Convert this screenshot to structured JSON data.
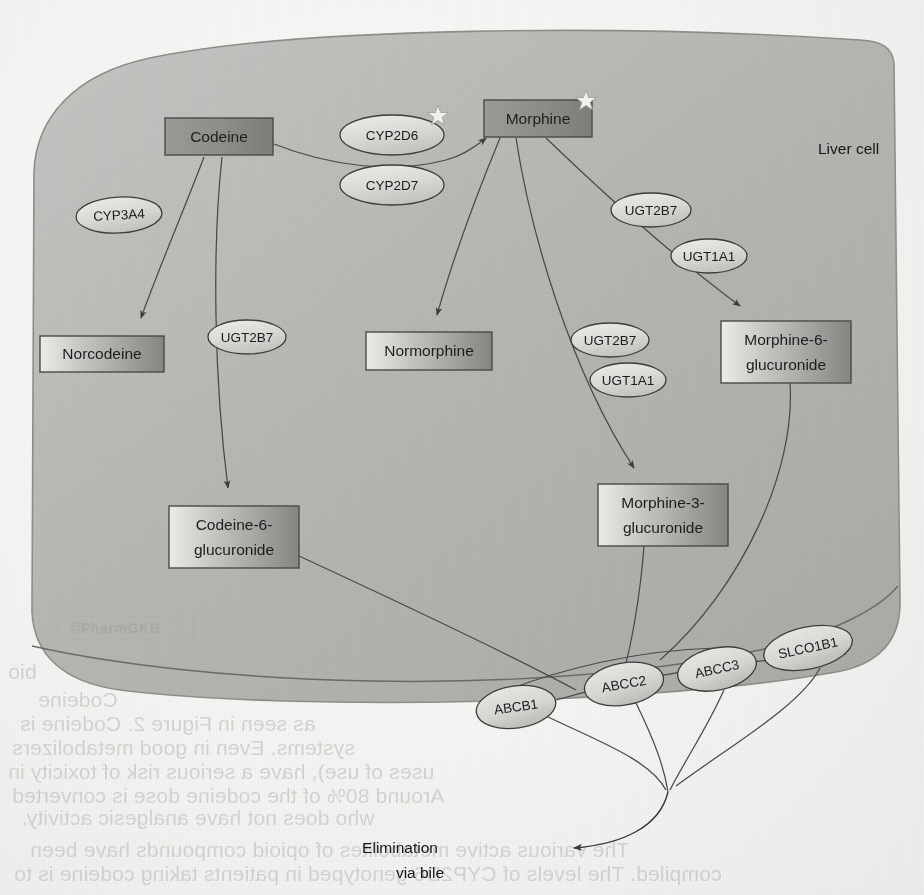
{
  "figure": {
    "cell_label": "Liver cell",
    "watermark": "©PharmGKB",
    "elimination_line1": "Elimination",
    "elimination_line2": "via bile"
  },
  "colors": {
    "cytoplasm": "#b4b5b1",
    "cytoplasm_light": "#c9cac6",
    "node_fill_dark": "#8d8e8a",
    "node_fill_light": "#e6e6e3",
    "node_stroke": "#4a4a48",
    "enzyme_fill": "#d9dad6",
    "enzyme_stroke": "#3d3d3b",
    "edge": "#4a4a4a",
    "text": "#1a1a1a",
    "watermark": "#a9aaa6",
    "page": "#f4f4f2"
  },
  "nodes": [
    {
      "id": "codeine",
      "label": "Codeine",
      "line1": "Codeine",
      "line2": "",
      "x": 165,
      "y": 118,
      "w": 108,
      "h": 37,
      "star": false
    },
    {
      "id": "morphine",
      "label": "Morphine",
      "line1": "Morphine",
      "line2": "",
      "x": 484,
      "y": 100,
      "w": 108,
      "h": 37,
      "star": true
    },
    {
      "id": "norcodeine",
      "label": "Norcodeine",
      "line1": "Norcodeine",
      "line2": "",
      "x": 40,
      "y": 336,
      "w": 124,
      "h": 36,
      "star": false
    },
    {
      "id": "normorphine",
      "label": "Normorphine",
      "line1": "Normorphine",
      "line2": "",
      "x": 366,
      "y": 332,
      "w": 126,
      "h": 38,
      "star": false
    },
    {
      "id": "m6g",
      "label": "Morphine-6-glucuronide",
      "line1": "Morphine-6-",
      "line2": "glucuronide",
      "x": 721,
      "y": 321,
      "w": 130,
      "h": 62,
      "star": false
    },
    {
      "id": "m3g",
      "label": "Morphine-3-glucuronide",
      "line1": "Morphine-3-",
      "line2": "glucuronide",
      "x": 598,
      "y": 484,
      "w": 130,
      "h": 62,
      "star": false
    },
    {
      "id": "c6g",
      "label": "Codeine-6-glucuronide",
      "line1": "Codeine-6-",
      "line2": "glucuronide",
      "x": 169,
      "y": 506,
      "w": 130,
      "h": 62,
      "star": false
    }
  ],
  "enzymes": [
    {
      "id": "cyp2d6",
      "label": "CYP2D6",
      "cx": 392,
      "cy": 135,
      "rx": 52,
      "ry": 20,
      "star": true,
      "rot": 0
    },
    {
      "id": "cyp2d7",
      "label": "CYP2D7",
      "cx": 392,
      "cy": 185,
      "rx": 52,
      "ry": 20,
      "star": false,
      "rot": 0
    },
    {
      "id": "cyp3a4",
      "label": "CYP3A4",
      "cx": 119,
      "cy": 215,
      "rx": 43,
      "ry": 18,
      "star": false,
      "rot": -3
    },
    {
      "id": "ugt2b7_c6g",
      "label": "UGT2B7",
      "cx": 247,
      "cy": 337,
      "rx": 39,
      "ry": 17,
      "star": false,
      "rot": 0
    },
    {
      "id": "ugt2b7_m6g",
      "label": "UGT2B7",
      "cx": 651,
      "cy": 210,
      "rx": 40,
      "ry": 17,
      "star": false,
      "rot": 0
    },
    {
      "id": "ugt1a1_m6g",
      "label": "UGT1A1",
      "cx": 709,
      "cy": 256,
      "rx": 38,
      "ry": 17,
      "star": false,
      "rot": 0
    },
    {
      "id": "ugt2b7_m3g",
      "label": "UGT2B7",
      "cx": 610,
      "cy": 340,
      "rx": 39,
      "ry": 17,
      "star": false,
      "rot": 0
    },
    {
      "id": "ugt1a1_m3g",
      "label": "UGT1A1",
      "cx": 628,
      "cy": 380,
      "rx": 38,
      "ry": 17,
      "star": false,
      "rot": 0
    }
  ],
  "transporters": [
    {
      "id": "abcb1",
      "label": "ABCB1",
      "cx": 516,
      "cy": 707,
      "rx": 40,
      "ry": 21,
      "rot": -8
    },
    {
      "id": "abcc2",
      "label": "ABCC2",
      "cx": 624,
      "cy": 684,
      "rx": 40,
      "ry": 21,
      "rot": -10
    },
    {
      "id": "abcc3",
      "label": "ABCC3",
      "cx": 717,
      "cy": 669,
      "rx": 40,
      "ry": 21,
      "rot": -12
    },
    {
      "id": "slco1b1",
      "label": "SLCO1B1",
      "cx": 808,
      "cy": 648,
      "rx": 45,
      "ry": 21,
      "rot": -12
    }
  ],
  "reactions": [
    {
      "from": "codeine",
      "to": "morphine",
      "via": [
        "CYP2D6",
        "CYP2D7"
      ]
    },
    {
      "from": "codeine",
      "to": "norcodeine",
      "via": [
        "CYP3A4"
      ]
    },
    {
      "from": "codeine",
      "to": "c6g",
      "via": [
        "UGT2B7"
      ]
    },
    {
      "from": "morphine",
      "to": "normorphine",
      "via": []
    },
    {
      "from": "morphine",
      "to": "m6g",
      "via": [
        "UGT2B7",
        "UGT1A1"
      ]
    },
    {
      "from": "morphine",
      "to": "m3g",
      "via": [
        "UGT2B7",
        "UGT1A1"
      ]
    },
    {
      "from": "m6g",
      "to": "elimination",
      "via": [
        "ABCC3",
        "SLCO1B1"
      ]
    },
    {
      "from": "m3g",
      "to": "elimination",
      "via": [
        "ABCB1",
        "ABCC2"
      ]
    },
    {
      "from": "c6g",
      "to": "elimination",
      "via": [
        "ABCB1",
        "ABCC2"
      ]
    }
  ],
  "bleed_text": [
    {
      "t": "bio",
      "x": 8,
      "y": 660
    },
    {
      "t": "Codeine",
      "x": 38,
      "y": 688
    },
    {
      "t": "as seen in Figure 2. Codeine is",
      "x": 20,
      "y": 712
    },
    {
      "t": "systems. Even in good metabolizers",
      "x": 12,
      "y": 736
    },
    {
      "t": "uses of use), have a serious risk of toxicity in",
      "x": 8,
      "y": 760
    },
    {
      "t": "Around 80% of the codeine dose is converted",
      "x": 12,
      "y": 784
    },
    {
      "t": "who does not have analgesic activity.",
      "x": 22,
      "y": 806
    },
    {
      "t": "The various active metabolites of opioid compounds have been",
      "x": 30,
      "y": 838
    },
    {
      "t": "compiled. The levels of CYP2D6 genotyped in patients taking codeine is to",
      "x": 14,
      "y": 862
    }
  ]
}
